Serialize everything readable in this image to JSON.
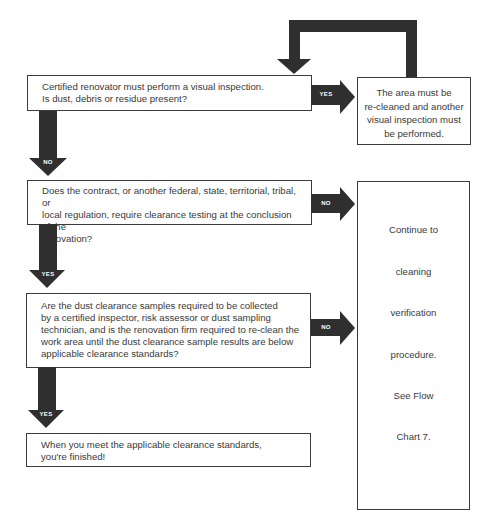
{
  "flowchart": {
    "steps": [
      {
        "id": "visual-inspection",
        "lines": [
          "Certified renovator must perform a visual inspection.",
          "Is dust, debris or residue present?"
        ]
      },
      {
        "id": "clearance-testing-required",
        "lines": [
          "Does the contract, or another federal, state, territorial, tribal, or",
          "local regulation, require clearance testing at the conclusion of the",
          "renovation?"
        ]
      },
      {
        "id": "dust-clearance-samples",
        "lines": [
          "Are the dust clearance samples required to be collected",
          "by a certified inspector, risk assessor or dust sampling",
          "technician, and is the renovation firm required to re-clean the",
          "work area until the dust clearance sample results are below",
          "applicable clearance standards?"
        ]
      },
      {
        "id": "finished",
        "lines": [
          "When you meet the applicable clearance standards,",
          "you're finished!"
        ]
      }
    ],
    "reclean_box": {
      "lines": [
        "The area must be",
        "re-cleaned and another",
        "visual inspection must",
        "be performed."
      ]
    },
    "continue_box": {
      "lines": [
        "Continue to",
        "cleaning",
        "verification",
        "procedure.",
        "See Flow",
        "Chart 7."
      ]
    },
    "arrows": {
      "step1_yes": "YES",
      "step1_no": "NO",
      "step2_no": "NO",
      "step2_yes": "YES",
      "step3_no": "NO",
      "step3_yes": "YES"
    },
    "colors": {
      "arrow": "#2f2f2f",
      "border": "#3c3c3c",
      "text": "#3a3a3a"
    }
  }
}
